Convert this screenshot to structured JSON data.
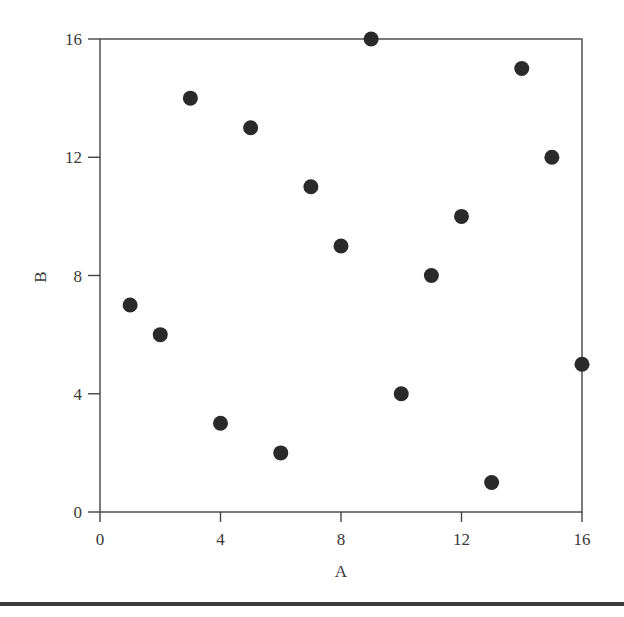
{
  "chart_data": {
    "type": "scatter",
    "title": "",
    "xlabel": "A",
    "ylabel": "B",
    "xlim": [
      0,
      16
    ],
    "ylim": [
      0,
      16
    ],
    "xticks": [
      0,
      4,
      8,
      12,
      16
    ],
    "yticks": [
      0,
      4,
      8,
      12,
      16
    ],
    "grid": false,
    "legend": null,
    "marker_color": "#2a2a2a",
    "series": [
      {
        "name": "points",
        "x": [
          1,
          2,
          3,
          4,
          5,
          6,
          7,
          8,
          9,
          10,
          11,
          12,
          13,
          14,
          15,
          16
        ],
        "y": [
          7,
          6,
          14,
          3,
          13,
          2,
          11,
          9,
          16,
          4,
          8,
          10,
          1,
          15,
          12,
          5
        ]
      }
    ]
  },
  "labels": {
    "x_axis": "A",
    "y_axis": "B",
    "x_ticks": [
      "0",
      "4",
      "8",
      "12",
      "16"
    ],
    "y_ticks": [
      "0",
      "4",
      "8",
      "12",
      "16"
    ]
  }
}
